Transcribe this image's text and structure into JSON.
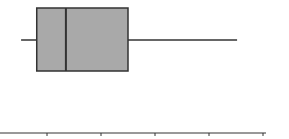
{
  "chart_data": {
    "type": "boxplot",
    "title": "",
    "xlabel": "",
    "ylabel": "",
    "orientation": "horizontal",
    "grid": false,
    "legend": null,
    "x_axis": {
      "tick_labels": [
        "",
        "",
        "",
        "",
        ""
      ],
      "tick_positions_px": [
        47,
        101,
        155,
        209,
        263
      ],
      "axis_y_px": 133,
      "axis_x_start_px": 0,
      "axis_x_end_px": 266
    },
    "series": [
      {
        "name": "",
        "min": -0.48,
        "q1": -0.19,
        "median": 0.35,
        "q3": 1.5,
        "max": 3.52
      }
    ],
    "scale": {
      "origin_px": 47,
      "px_per_unit": 54
    },
    "style": {
      "box_fill": "#a9a9a9",
      "stroke": "#333333",
      "box_top_px": 8,
      "box_bottom_px": 71,
      "whisker_y_px": 40
    }
  }
}
